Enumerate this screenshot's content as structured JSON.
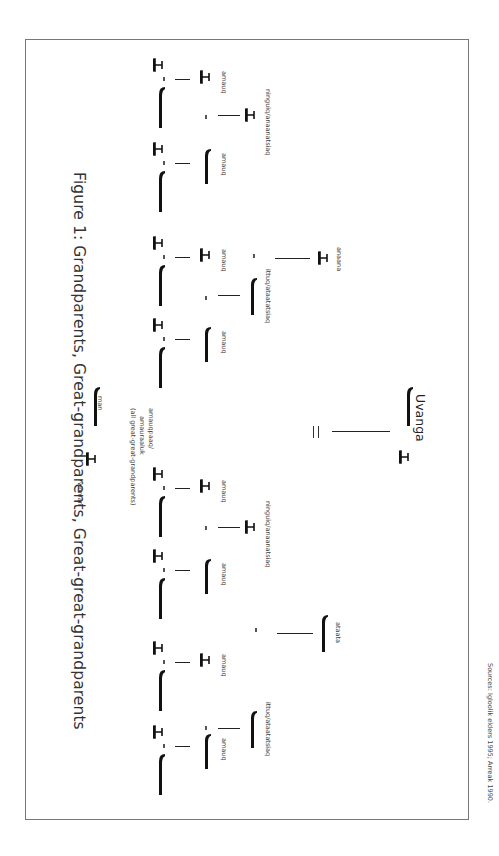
{
  "figure": {
    "title": "Figure 1: Grandparents, Great-grandparents, Great-great-grandparents",
    "source": "Sources: Igloolik elders 1995; Arreak 1990.",
    "orientation": "rotated 90° clockwise",
    "legend": {
      "woman": "woman",
      "man": "man"
    }
  },
  "generations": {
    "great_great_grandparents": {
      "label": "amauqpaaq/ amauraaluk (all great-great-grandparents)",
      "label_line1": "amauqpaaq/",
      "label_line2": "amauraaluk",
      "label_line3": "(all great-great-grandparents)",
      "count_couples": 8
    },
    "great_grandparents": [
      {
        "label": "amauq",
        "sex": "woman"
      },
      {
        "label": "amauq",
        "sex": "man"
      },
      {
        "label": "amauq",
        "sex": "woman"
      },
      {
        "label": "amauq",
        "sex": "man"
      },
      {
        "label": "amauq",
        "sex": "woman"
      },
      {
        "label": "amauq",
        "sex": "man"
      },
      {
        "label": "amauq",
        "sex": "woman"
      },
      {
        "label": "amauq",
        "sex": "man"
      }
    ],
    "grandparents": [
      {
        "label": "ninguiq/anaanatsiaq",
        "sex": "woman"
      },
      {
        "label": "ittuq/ataatatsiaq",
        "sex": "man"
      },
      {
        "label": "ninguiq/anaanatsiaq",
        "sex": "woman"
      },
      {
        "label": "ittuq/ataatatsiaq",
        "sex": "man"
      }
    ],
    "parents": [
      {
        "label": "anaana",
        "sex": "woman"
      },
      {
        "label": "ataata",
        "sex": "man"
      }
    ],
    "ego": {
      "label": "Uvanga"
    }
  }
}
